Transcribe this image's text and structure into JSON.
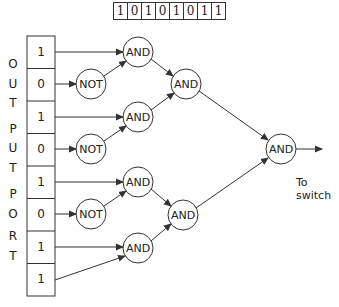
{
  "top_register": {
    "bits": [
      "1",
      "0",
      "1",
      "0",
      "1",
      "0",
      "1",
      "1"
    ]
  },
  "port_label": {
    "letters": [
      "O",
      "U",
      "T",
      "P",
      "U",
      "T",
      "P",
      "O",
      "R",
      "T"
    ],
    "text": "OUTPUT PORT"
  },
  "output_port": {
    "cells": [
      "1",
      "0",
      "1",
      "0",
      "1",
      "0",
      "1",
      "1"
    ]
  },
  "gates": {
    "not_label": "NOT",
    "and_label": "AND",
    "not_gates": [
      {
        "id": "not1",
        "input_cell": 1
      },
      {
        "id": "not2",
        "input_cell": 3
      },
      {
        "id": "not3",
        "input_cell": 5
      }
    ],
    "and_level1": [
      {
        "id": "and1",
        "inputs": [
          "cell0",
          "not1"
        ]
      },
      {
        "id": "and2",
        "inputs": [
          "cell2",
          "not2"
        ]
      },
      {
        "id": "and3",
        "inputs": [
          "cell4",
          "not3"
        ]
      },
      {
        "id": "and4",
        "inputs": [
          "cell6",
          "cell7"
        ]
      }
    ],
    "and_level2": [
      {
        "id": "and5",
        "inputs": [
          "and1",
          "and2"
        ]
      },
      {
        "id": "and6",
        "inputs": [
          "and3",
          "and4"
        ]
      }
    ],
    "and_final": {
      "id": "and7",
      "inputs": [
        "and5",
        "and6"
      ]
    }
  },
  "output_note": {
    "line1": "To",
    "line2": "switch"
  },
  "colors": {
    "stroke": "#333333",
    "background": "#ffffff"
  }
}
